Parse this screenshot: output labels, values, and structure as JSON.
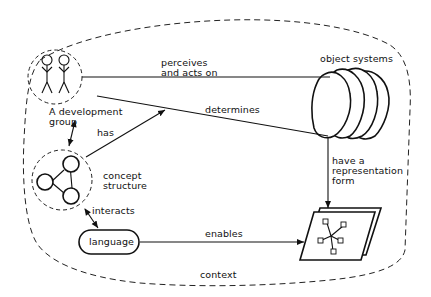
{
  "diagram": {
    "context_label": "context",
    "nodes": {
      "development_group": {
        "label_line1": "A development",
        "label_line2": "group"
      },
      "concept_structure": {
        "label_line1": "concept",
        "label_line2": "structure"
      },
      "language": {
        "label": "language"
      },
      "object_systems": {
        "label": "object systems"
      },
      "representation": {
        "label": "representation form document"
      }
    },
    "edges": {
      "perceives": {
        "line1": "perceives",
        "line2": "and acts on"
      },
      "determines": {
        "label": "determines"
      },
      "has": {
        "label": "has"
      },
      "interacts": {
        "label": "interacts"
      },
      "enables": {
        "label": "enables"
      },
      "have_representation": {
        "line1": "have a",
        "line2": "representation",
        "line3": "form"
      }
    },
    "colors": {
      "ink": "#111111",
      "background": "#ffffff"
    }
  }
}
